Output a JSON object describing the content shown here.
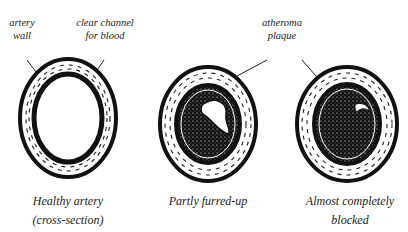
{
  "labels": {
    "artery_wall": [
      "artery",
      "wall"
    ],
    "clear_channel": [
      "clear channel",
      "for blood"
    ],
    "atheroma_plaque": [
      "atheroma",
      "plaque"
    ]
  },
  "captions": [
    {
      "line1": "Healthy artery",
      "line2": "(cross-section)"
    },
    {
      "line1": "Partly furred-up",
      "line2": ""
    },
    {
      "line1": "Almost completely",
      "line2": "blocked"
    }
  ],
  "colors": {
    "ink": "#111111",
    "background": "#ffffff"
  }
}
